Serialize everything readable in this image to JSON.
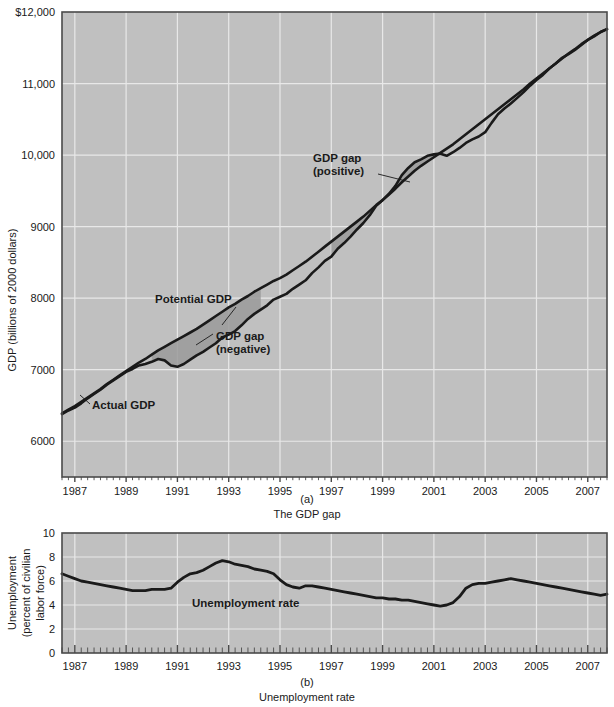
{
  "figure": {
    "panels": [
      {
        "id": "a",
        "panel_label": "(a)",
        "caption": "The GDP gap"
      },
      {
        "id": "b",
        "panel_label": "(b)",
        "caption": "Unemployment rate"
      }
    ]
  },
  "panel_a": {
    "ylabel": "GDP (billions of 2000 dollars)",
    "ytick_labels": [
      "$12,000",
      "11,000",
      "10,000",
      "9000",
      "8000",
      "7000",
      "6000"
    ],
    "xtick_labels": [
      "1987",
      "1989",
      "1991",
      "1993",
      "1995",
      "1997",
      "1999",
      "2001",
      "2003",
      "2005",
      "2007"
    ],
    "annotations": {
      "actual": "Actual GDP",
      "potential": "Potential GDP",
      "gap_neg_line1": "GDP gap",
      "gap_neg_line2": "(negative)",
      "gap_pos_line1": "GDP gap",
      "gap_pos_line2": "(positive)"
    }
  },
  "panel_b": {
    "ylabel_line1": "Unemployment",
    "ylabel_line2": "(percent of civilian",
    "ylabel_line3": "labor force)",
    "ytick_labels": [
      "10",
      "8",
      "6",
      "4",
      "2",
      "0"
    ],
    "xtick_labels": [
      "1987",
      "1989",
      "1991",
      "1993",
      "1995",
      "1997",
      "1999",
      "2001",
      "2003",
      "2005",
      "2007"
    ],
    "annotations": {
      "series": "Unemployment rate"
    }
  },
  "colors": {
    "plot_background": "#c0c0c0",
    "gridline": "#e8e8e8",
    "line": "#1a1a1a",
    "gap_fill": "#9a9a9a",
    "axis": "#4a4a4a",
    "text": "#1a1a1a"
  },
  "chart_data": [
    {
      "type": "line",
      "id": "gdp-gap",
      "title": "The GDP gap",
      "xlabel": "",
      "ylabel": "GDP (billions of 2000 dollars)",
      "xlim": [
        1986.5,
        2007.75
      ],
      "ylim": [
        5500,
        12000
      ],
      "ytick_values": [
        12000,
        11000,
        10000,
        9000,
        8000,
        7000,
        6000
      ],
      "xtick_values": [
        1987,
        1989,
        1991,
        1993,
        1995,
        1997,
        1999,
        2001,
        2003,
        2005,
        2007
      ],
      "grid": true,
      "legend_position": "inline-annotations",
      "x": [
        1986.5,
        1986.75,
        1987,
        1987.25,
        1987.5,
        1987.75,
        1988,
        1988.25,
        1988.5,
        1988.75,
        1989,
        1989.25,
        1989.5,
        1989.75,
        1990,
        1990.25,
        1990.5,
        1990.75,
        1991,
        1991.25,
        1991.5,
        1991.75,
        1992,
        1992.25,
        1992.5,
        1992.75,
        1993,
        1993.25,
        1993.5,
        1993.75,
        1994,
        1994.25,
        1994.5,
        1994.75,
        1995,
        1995.25,
        1995.5,
        1995.75,
        1996,
        1996.25,
        1996.5,
        1996.75,
        1997,
        1997.25,
        1997.5,
        1997.75,
        1998,
        1998.25,
        1998.5,
        1998.75,
        1999,
        1999.25,
        1999.5,
        1999.75,
        2000,
        2000.25,
        2000.5,
        2000.75,
        2001,
        2001.25,
        2001.5,
        2001.75,
        2002,
        2002.25,
        2002.5,
        2002.75,
        2003,
        2003.25,
        2003.5,
        2003.75,
        2004,
        2004.25,
        2004.5,
        2004.75,
        2005,
        2005.25,
        2005.5,
        2005.75,
        2006,
        2006.25,
        2006.5,
        2006.75,
        2007,
        2007.25,
        2007.5,
        2007.75
      ],
      "series": [
        {
          "name": "Actual GDP",
          "values": [
            6380,
            6430,
            6470,
            6530,
            6600,
            6660,
            6720,
            6790,
            6850,
            6910,
            6970,
            7010,
            7060,
            7080,
            7110,
            7150,
            7130,
            7060,
            7040,
            7080,
            7140,
            7200,
            7250,
            7310,
            7370,
            7450,
            7490,
            7540,
            7620,
            7710,
            7780,
            7840,
            7900,
            7980,
            8020,
            8060,
            8130,
            8190,
            8250,
            8350,
            8430,
            8520,
            8580,
            8690,
            8770,
            8860,
            8960,
            9050,
            9160,
            9290,
            9370,
            9460,
            9570,
            9720,
            9820,
            9900,
            9940,
            9990,
            10010,
            10020,
            9990,
            10040,
            10100,
            10170,
            10220,
            10260,
            10320,
            10450,
            10570,
            10650,
            10720,
            10800,
            10880,
            10970,
            11050,
            11120,
            11210,
            11280,
            11360,
            11410,
            11470,
            11540,
            11610,
            11660,
            11720,
            11760
          ]
        },
        {
          "name": "Potential GDP",
          "values": [
            6390,
            6440,
            6490,
            6550,
            6610,
            6670,
            6730,
            6800,
            6860,
            6920,
            6980,
            7040,
            7100,
            7150,
            7210,
            7270,
            7320,
            7370,
            7420,
            7470,
            7520,
            7570,
            7630,
            7690,
            7750,
            7810,
            7870,
            7920,
            7980,
            8030,
            8090,
            8140,
            8190,
            8240,
            8280,
            8330,
            8390,
            8450,
            8510,
            8580,
            8650,
            8720,
            8790,
            8860,
            8930,
            9000,
            9070,
            9140,
            9220,
            9300,
            9370,
            9450,
            9530,
            9620,
            9700,
            9780,
            9850,
            9910,
            9970,
            10030,
            10090,
            10150,
            10220,
            10290,
            10360,
            10430,
            10500,
            10570,
            10640,
            10710,
            10780,
            10850,
            10920,
            11000,
            11070,
            11140,
            11210,
            11280,
            11350,
            11420,
            11480,
            11550,
            11610,
            11670,
            11720,
            11760
          ]
        }
      ],
      "gap_regions": [
        {
          "label": "GDP gap (negative)",
          "sign": "negative",
          "x_start": 1989.9,
          "x_end": 1994.3
        },
        {
          "label": "GDP gap (positive)",
          "sign": "positive",
          "x_start": 1996.9,
          "x_end": 2001.1
        }
      ]
    },
    {
      "type": "line",
      "id": "unemployment-rate",
      "title": "Unemployment rate",
      "xlabel": "",
      "ylabel": "Unemployment (percent of civilian labor force)",
      "xlim": [
        1986.5,
        2007.75
      ],
      "ylim": [
        0,
        10
      ],
      "ytick_values": [
        10,
        8,
        6,
        4,
        2,
        0
      ],
      "xtick_values": [
        1987,
        1989,
        1991,
        1993,
        1995,
        1997,
        1999,
        2001,
        2003,
        2005,
        2007
      ],
      "grid": true,
      "legend_position": "inline-annotation",
      "x": [
        1986.5,
        1986.75,
        1987,
        1987.25,
        1987.5,
        1987.75,
        1988,
        1988.25,
        1988.5,
        1988.75,
        1989,
        1989.25,
        1989.5,
        1989.75,
        1990,
        1990.25,
        1990.5,
        1990.75,
        1991,
        1991.25,
        1991.5,
        1991.75,
        1992,
        1992.25,
        1992.5,
        1992.75,
        1993,
        1993.25,
        1993.5,
        1993.75,
        1994,
        1994.25,
        1994.5,
        1994.75,
        1995,
        1995.25,
        1995.5,
        1995.75,
        1996,
        1996.25,
        1996.5,
        1996.75,
        1997,
        1997.25,
        1997.5,
        1997.75,
        1998,
        1998.25,
        1998.5,
        1998.75,
        1999,
        1999.25,
        1999.5,
        1999.75,
        2000,
        2000.25,
        2000.5,
        2000.75,
        2001,
        2001.25,
        2001.5,
        2001.75,
        2002,
        2002.25,
        2002.5,
        2002.75,
        2003,
        2003.25,
        2003.5,
        2003.75,
        2004,
        2004.25,
        2004.5,
        2004.75,
        2005,
        2005.25,
        2005.5,
        2005.75,
        2006,
        2006.25,
        2006.5,
        2006.75,
        2007,
        2007.25,
        2007.5,
        2007.75
      ],
      "series": [
        {
          "name": "Unemployment rate",
          "values": [
            6.6,
            6.4,
            6.2,
            6.0,
            5.9,
            5.8,
            5.7,
            5.6,
            5.5,
            5.4,
            5.3,
            5.2,
            5.2,
            5.2,
            5.3,
            5.3,
            5.3,
            5.4,
            5.9,
            6.3,
            6.6,
            6.7,
            6.9,
            7.2,
            7.5,
            7.7,
            7.6,
            7.4,
            7.3,
            7.2,
            7.0,
            6.9,
            6.8,
            6.6,
            6.1,
            5.7,
            5.5,
            5.4,
            5.6,
            5.6,
            5.5,
            5.4,
            5.3,
            5.2,
            5.1,
            5.0,
            4.9,
            4.8,
            4.7,
            4.6,
            4.6,
            4.5,
            4.5,
            4.4,
            4.4,
            4.3,
            4.2,
            4.1,
            4.0,
            3.9,
            4.0,
            4.2,
            4.7,
            5.4,
            5.7,
            5.8,
            5.8,
            5.9,
            6.0,
            6.1,
            6.2,
            6.1,
            6.0,
            5.9,
            5.8,
            5.7,
            5.6,
            5.5,
            5.4,
            5.3,
            5.2,
            5.1,
            5.0,
            4.9,
            4.8,
            4.9
          ]
        }
      ]
    }
  ]
}
